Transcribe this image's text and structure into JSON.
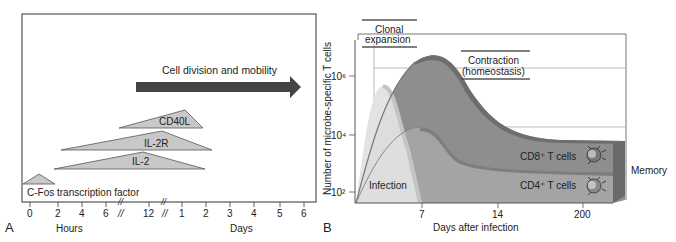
{
  "panelA": {
    "label": "A",
    "arrow_label": "Cell division and mobility",
    "bars": [
      {
        "label": "CD40L"
      },
      {
        "label": "IL-2R"
      },
      {
        "label": "IL-2"
      },
      {
        "label": "C-Fos transcription factor"
      }
    ],
    "x_ticks": [
      "0",
      "2",
      "4",
      "6",
      "//",
      "12",
      "//",
      "1",
      "2",
      "3",
      "4",
      "5",
      "6"
    ],
    "x_label_hours": "Hours",
    "x_label_days": "Days",
    "colors": {
      "bar_fill": "#c8c8c8",
      "arrow": "#444444"
    }
  },
  "panelB": {
    "label": "B",
    "y_label": "Number of microbe-specific T cells",
    "y_ticks": [
      "10⁶",
      "10⁴",
      "10²"
    ],
    "x_ticks": [
      "7",
      "14",
      "200"
    ],
    "x_label": "Days after infection",
    "phase_clonal": "Clonal expansion",
    "phase_clonal_line1": "Clonal",
    "phase_clonal_line2": "expansion",
    "phase_contraction_line1": "Contraction",
    "phase_contraction_line2": "(homeostasis)",
    "infection_label": "Infection",
    "cd8_label": "CD8⁺ T cells",
    "cd4_label": "CD4⁺ T cells",
    "memory_label": "Memory",
    "colors": {
      "cd8": "#8a8a8a",
      "cd4": "#a0a0a0",
      "infection": "#e3e3e3"
    }
  }
}
